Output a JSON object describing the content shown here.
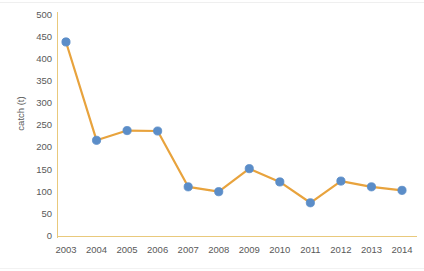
{
  "chart_data": {
    "type": "line",
    "title": "",
    "xlabel": "",
    "ylabel": "catch (t)",
    "categories": [
      "2003",
      "2004",
      "2005",
      "2006",
      "2007",
      "2008",
      "2009",
      "2010",
      "2011",
      "2012",
      "2013",
      "2014"
    ],
    "values": [
      438,
      216,
      238,
      237,
      111,
      100,
      152,
      122,
      75,
      124,
      111,
      103
    ],
    "series": [
      {
        "name": "catch",
        "values": [
          438,
          216,
          238,
          237,
          111,
          100,
          152,
          122,
          75,
          124,
          111,
          103
        ]
      }
    ],
    "ylim": [
      0,
      500
    ],
    "ytick_values": [
      0,
      50,
      100,
      150,
      200,
      250,
      300,
      350,
      400,
      450,
      500
    ],
    "ytick_labels": [
      "0",
      "50",
      "100",
      "150",
      "200",
      "250",
      "300",
      "350",
      "400",
      "450",
      "500"
    ],
    "grid": false,
    "legend": "none",
    "marker": "circle",
    "colors": {
      "line": "#e8a33d",
      "marker_fill": "#5b8dc8",
      "marker_stroke": "#5b8dc8",
      "axis": "#e9c97c",
      "tick_text": "#595959",
      "axis_title": "#585858",
      "background": "#ffffff"
    }
  }
}
